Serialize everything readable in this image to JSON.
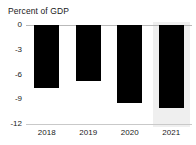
{
  "chart_data": {
    "type": "bar",
    "title": "Percent of GDP",
    "subtitle": "",
    "xlabel": "",
    "ylabel": "",
    "categories": [
      "2018",
      "2019",
      "2020",
      "2021"
    ],
    "values": [
      -7.6,
      -6.8,
      -9.5,
      -10.1
    ],
    "ylim": [
      -12,
      0
    ],
    "yticks": [
      0,
      -3,
      -6,
      -9,
      -12
    ],
    "ytick_labels": [
      "0",
      "-3",
      "-6",
      "-9",
      "-12"
    ],
    "grid": false,
    "legend": null,
    "legend_position": "none",
    "bar_color": "#000000",
    "projection_band_color": "#efefef",
    "projection_categories": [
      "2021"
    ],
    "axis_color": "#b9b9b9",
    "text_color": "#1a1a1a",
    "annotations": []
  }
}
